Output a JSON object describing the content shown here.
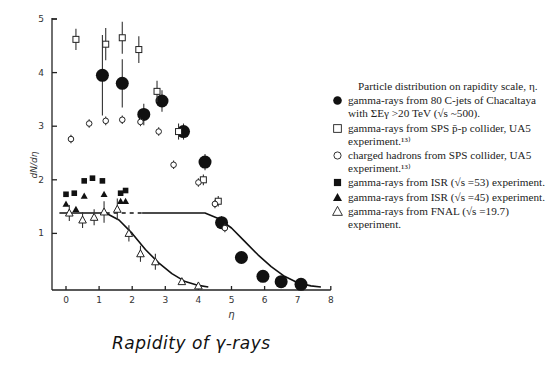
{
  "chart_data": {
    "type": "scatter",
    "title": "Particle distribution on rapidity scale, η.",
    "xlabel": "η",
    "ylabel": "dN/dη",
    "xtitle": "Rapidity of γ-rays",
    "xlim": [
      -0.3,
      8
    ],
    "ylim": [
      0,
      5
    ],
    "xticks": [
      "0",
      "1",
      "2",
      "3",
      "4",
      "5",
      "6",
      "7",
      "8"
    ],
    "yticks": [
      "1",
      "2",
      "3",
      "4",
      "5"
    ],
    "grid": false,
    "legend_position": "right",
    "series": [
      {
        "name": "gamma-rays from 80 C-jets of Chacaltaya with ΣEγ >20 TeV (√s ~500).",
        "marker": "filled-circle",
        "x": [
          1.1,
          1.7,
          2.35,
          2.9,
          3.55,
          4.2,
          4.7,
          5.3,
          5.95,
          6.5,
          7.1
        ],
        "y": [
          3.95,
          3.8,
          3.22,
          3.47,
          2.9,
          2.33,
          1.2,
          0.55,
          0.2,
          0.1,
          0.05
        ],
        "err": [
          0.75,
          0.45,
          0.2,
          0.2,
          0.15,
          0.15,
          0.12,
          0,
          0,
          0,
          0
        ]
      },
      {
        "name": "gamma-rays from SPS p̄-p collider, UA5 experiment.",
        "marker": "open-square",
        "x": [
          0.3,
          1.2,
          1.7,
          2.2,
          2.75,
          3.4,
          4.15,
          4.6
        ],
        "y": [
          4.62,
          4.53,
          4.65,
          4.43,
          3.65,
          2.9,
          2.0,
          1.6
        ],
        "err": [
          0.2,
          0.3,
          0.3,
          0.25,
          0.2,
          0.15,
          0.1,
          0.1
        ]
      },
      {
        "name": "charged hadrons from SPS collider, UA5 experiment.",
        "marker": "open-circle",
        "x": [
          0.15,
          0.7,
          1.2,
          1.7,
          2.25,
          2.8,
          3.25,
          4.0,
          4.5,
          4.8
        ],
        "y": [
          2.76,
          3.05,
          3.1,
          3.12,
          3.08,
          2.9,
          2.28,
          1.95,
          1.55,
          1.1
        ],
        "err": [
          0.08,
          0.08,
          0.08,
          0.08,
          0.08,
          0.08,
          0.08,
          0.08,
          0.08,
          0.08
        ]
      },
      {
        "name": "gamma-rays from ISR (√s =53) experiment.",
        "marker": "filled-square",
        "x": [
          0.0,
          0.25,
          0.55,
          0.8,
          1.1,
          1.65,
          1.8
        ],
        "y": [
          1.73,
          1.75,
          1.98,
          2.03,
          1.98,
          1.75,
          1.8
        ]
      },
      {
        "name": "gamma-rays from ISR (√s =45) experiment.",
        "marker": "filled-triangle",
        "x": [
          0.0,
          0.3,
          0.55,
          1.15,
          1.65,
          1.8
        ],
        "y": [
          1.55,
          1.45,
          1.7,
          1.73,
          1.6,
          1.6
        ]
      },
      {
        "name": "gamma-rays from FNAL (√s =19.7) experiment.",
        "marker": "open-triangle",
        "x": [
          0.1,
          0.5,
          0.85,
          1.15,
          1.55,
          1.9,
          2.25,
          2.7,
          3.5,
          4.0
        ],
        "y": [
          1.38,
          1.25,
          1.3,
          1.4,
          1.45,
          1.0,
          0.62,
          0.47,
          0.1,
          0.02
        ],
        "err": [
          0.15,
          0.15,
          0.15,
          0.2,
          0.2,
          0.15,
          0.15,
          0.15,
          0,
          0
        ]
      }
    ],
    "curves": [
      {
        "name": "fit-curve-low-energy",
        "style": "solid",
        "plateau": 1.38,
        "x": [
          -0.2,
          1.2,
          1.6,
          2.0,
          2.4,
          2.8,
          3.2,
          3.6,
          4.0,
          4.3
        ],
        "y": [
          1.38,
          1.38,
          1.25,
          1.0,
          0.7,
          0.45,
          0.25,
          0.1,
          0.03,
          0
        ]
      },
      {
        "name": "plateau-dashed",
        "style": "dashed",
        "x": [
          1.2,
          2.3
        ],
        "y": [
          1.38,
          1.38
        ]
      },
      {
        "name": "fit-curve-high-energy",
        "style": "solid",
        "x": [
          2.3,
          4.2,
          4.6,
          5.0,
          5.4,
          5.8,
          6.2,
          6.6,
          7.0,
          7.4,
          7.7
        ],
        "y": [
          1.38,
          1.38,
          1.28,
          1.1,
          0.85,
          0.6,
          0.38,
          0.2,
          0.08,
          0.02,
          0
        ]
      }
    ]
  },
  "legend": {
    "title": "Particle distribution on rapidity scale, η.",
    "items": [
      {
        "marker": "filled-circle",
        "text": "gamma-rays from 80 C-jets of Chacaltaya with ΣEγ >20 TeV (√s ~500)."
      },
      {
        "marker": "open-square",
        "text": "gamma-rays from SPS p̄-p collider, UA5 experiment.¹³⁾"
      },
      {
        "marker": "open-circle",
        "text": "charged hadrons from SPS collider, UA5 experiment.¹³⁾"
      },
      {
        "marker": "filled-square",
        "text": "gamma-rays from ISR (√s =53) experiment."
      },
      {
        "marker": "filled-triangle",
        "text": "gamma-rays from ISR (√s =45) experiment."
      },
      {
        "marker": "open-triangle",
        "text": "gamma-rays from FNAL (√s =19.7) experiment."
      }
    ]
  }
}
